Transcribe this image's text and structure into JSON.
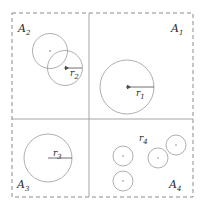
{
  "figure": {
    "width": 207,
    "height": 212,
    "background_color": "#ffffff",
    "stroke_color": "#8c8c8c",
    "label_color": "#2b2b2b",
    "divider_color": "#9a9a9a",
    "boundary": {
      "style": "dashed",
      "x": 12,
      "y": 13,
      "width": 181,
      "height": 184,
      "dash_pattern": "4 3"
    },
    "dividers": {
      "style": "solid",
      "vertical_x": 89,
      "horizontal_y": 119
    },
    "regions": [
      {
        "id": "A1",
        "label": "A",
        "subscript": "1",
        "label_x": 172,
        "label_y": 32,
        "quadrant": "top-right",
        "radius_label": "r",
        "radius_subscript": "1",
        "circles": [
          {
            "cx": 127,
            "cy": 87,
            "r": 27,
            "has_center_dot": true
          }
        ],
        "radius_arrow": {
          "from_x": 127,
          "from_y": 87,
          "to_x": 154,
          "to_y": 87,
          "label_x": 137,
          "label_y": 95
        }
      },
      {
        "id": "A2",
        "label": "A",
        "subscript": "2",
        "label_x": 18,
        "label_y": 32,
        "quadrant": "top-left",
        "radius_label": "r",
        "radius_subscript": "2",
        "circles": [
          {
            "cx": 50,
            "cy": 51,
            "r": 17.5,
            "has_center_dot": true
          },
          {
            "cx": 65,
            "cy": 68,
            "r": 17.5,
            "has_center_dot": true
          }
        ],
        "radius_arrow": {
          "from_x": 65,
          "from_y": 68,
          "to_x": 82,
          "to_y": 68,
          "label_x": 70,
          "label_y": 76
        }
      },
      {
        "id": "A3",
        "label": "A",
        "subscript": "3",
        "label_x": 18,
        "label_y": 187,
        "quadrant": "bottom-left",
        "radius_label": "r",
        "radius_subscript": "3",
        "circles": [
          {
            "cx": 48,
            "cy": 158,
            "r": 24,
            "has_center_dot": false
          }
        ],
        "radius_arrow": {
          "from_x": 48,
          "from_y": 158,
          "to_x": 72,
          "to_y": 158,
          "label_x": 54,
          "label_y": 156
        }
      },
      {
        "id": "A4",
        "label": "A",
        "subscript": "4",
        "label_x": 170,
        "label_y": 187,
        "quadrant": "bottom-right",
        "radius_label": "r",
        "radius_subscript": "4",
        "circles": [
          {
            "cx": 123,
            "cy": 156,
            "r": 10,
            "has_center_dot": true
          },
          {
            "cx": 123,
            "cy": 181,
            "r": 10,
            "has_center_dot": true
          },
          {
            "cx": 158,
            "cy": 158,
            "r": 10,
            "has_center_dot": true
          },
          {
            "cx": 176,
            "cy": 145,
            "r": 10,
            "has_center_dot": true
          }
        ],
        "radius_arrow": null,
        "free_label": {
          "x": 140,
          "y": 140
        }
      }
    ]
  }
}
